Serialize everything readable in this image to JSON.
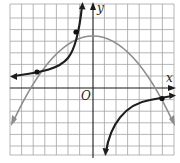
{
  "graph": {
    "x_axis_label": "x",
    "y_axis_label": "y",
    "origin_label": "O",
    "grid": {
      "left": 10,
      "top": 4,
      "cell": 11.6,
      "cols": 14,
      "rows": 13,
      "color": "#9a9a9a"
    },
    "axes": {
      "origin_px": [
        93,
        88
      ],
      "color": "#1a1a1a"
    },
    "curves": [
      {
        "name": "parabola",
        "color": "#8c8c8c",
        "description": "downward opening parabola, vertex near (0, 5)"
      },
      {
        "name": "rational-function",
        "color": "#1e1e1e",
        "description": "two-branch curve with vertical asymptote near x = -1"
      }
    ],
    "points": [
      {
        "label": "intersection-1",
        "x": -5,
        "y": 1.5
      },
      {
        "label": "intersection-2",
        "x": -1.5,
        "y": 4.2
      },
      {
        "label": "intersection-3",
        "x": 6,
        "y": -1.3
      }
    ]
  }
}
